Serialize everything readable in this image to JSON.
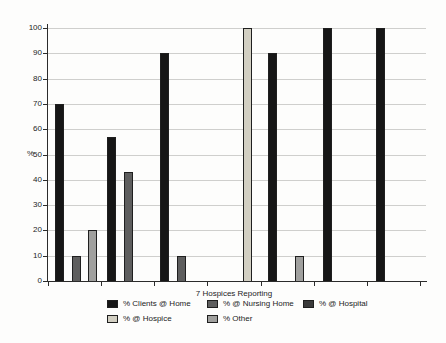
{
  "chart_data": {
    "type": "bar",
    "title": "",
    "xlabel": "7 Hospices Reporting",
    "ylabel": "%",
    "ylim": [
      0,
      100
    ],
    "yticks": [
      0,
      10,
      20,
      30,
      40,
      50,
      60,
      70,
      80,
      90,
      100
    ],
    "grid": true,
    "legend_position": "bottom",
    "n_groups": 7,
    "series": [
      {
        "name": "% Clients @ Home",
        "color": "#161616",
        "values": [
          70,
          57,
          90,
          0,
          90,
          100,
          100
        ]
      },
      {
        "name": "% @ Hospice",
        "color": "#d2cfc2",
        "values": [
          0,
          0,
          0,
          100,
          0,
          0,
          0
        ]
      },
      {
        "name": "% @ Nursing Home",
        "color": "#5e5e5e",
        "values": [
          10,
          43,
          10,
          0,
          0,
          0,
          0
        ]
      },
      {
        "name": "% Other",
        "color": "#a0a09e",
        "values": [
          20,
          0,
          0,
          0,
          10,
          0,
          0
        ]
      },
      {
        "name": "% @ Hospital",
        "color": "#3a3a3a",
        "values": [
          0,
          0,
          0,
          0,
          0,
          0,
          0
        ]
      }
    ]
  }
}
